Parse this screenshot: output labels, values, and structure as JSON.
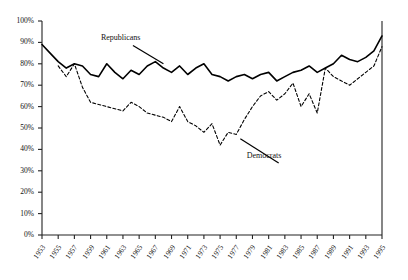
{
  "chart_data": {
    "type": "line",
    "title": "",
    "subtitle": "",
    "xlabel": "",
    "ylabel": "",
    "grid": false,
    "legend_position": "inline-annotation",
    "xlim": [
      1953,
      1995
    ],
    "ylim": [
      0,
      100
    ],
    "ytick_labels": [
      "100%",
      "90%",
      "80%",
      "70%",
      "60%",
      "50%",
      "40%",
      "30%",
      "20%",
      "10%",
      "0%"
    ],
    "ytick_values": [
      100,
      90,
      80,
      70,
      60,
      50,
      40,
      30,
      20,
      10,
      0
    ],
    "xtick_labels": [
      "1953",
      "1955",
      "1957",
      "1959",
      "1961",
      "1963",
      "1965",
      "1967",
      "1969",
      "1971",
      "1973",
      "1975",
      "1977",
      "1979",
      "1981",
      "1983",
      "1985",
      "1987",
      "1989",
      "1991",
      "1993",
      "1995"
    ],
    "xtick_values": [
      1953,
      1955,
      1957,
      1959,
      1961,
      1963,
      1965,
      1967,
      1969,
      1971,
      1973,
      1975,
      1977,
      1979,
      1981,
      1983,
      1985,
      1987,
      1989,
      1991,
      1993,
      1995
    ],
    "annotations": [
      {
        "text": "Republicans",
        "x": 1963,
        "y": 90,
        "leader_to_x": 1968,
        "leader_to_y": 80
      },
      {
        "text": "Democrats",
        "x": 1981,
        "y": 35,
        "leader_to_x": 1977.5,
        "leader_to_y": 45
      }
    ],
    "series": [
      {
        "name": "Republicans",
        "style": "solid",
        "color": "#000000",
        "x": [
          1953,
          1954,
          1955,
          1956,
          1957,
          1958,
          1959,
          1960,
          1961,
          1962,
          1963,
          1964,
          1965,
          1966,
          1967,
          1968,
          1969,
          1970,
          1971,
          1972,
          1973,
          1974,
          1975,
          1976,
          1977,
          1978,
          1979,
          1980,
          1981,
          1982,
          1983,
          1984,
          1985,
          1986,
          1987,
          1988,
          1989,
          1990,
          1991,
          1992,
          1993,
          1994,
          1995
        ],
        "values": [
          89,
          85,
          81,
          78,
          80,
          79,
          75,
          74,
          80,
          76,
          73,
          77,
          75,
          79,
          81,
          78,
          76,
          79,
          75,
          78,
          80,
          75,
          74,
          72,
          74,
          75,
          73,
          75,
          76,
          72,
          74,
          76,
          77,
          79,
          76,
          78,
          80,
          84,
          82,
          81,
          83,
          86,
          93
        ]
      },
      {
        "name": "Democrats",
        "style": "dashed",
        "color": "#000000",
        "x": [
          1955,
          1956,
          1957,
          1958,
          1959,
          1960,
          1961,
          1962,
          1963,
          1964,
          1965,
          1966,
          1967,
          1968,
          1969,
          1970,
          1971,
          1972,
          1973,
          1974,
          1975,
          1976,
          1977,
          1978,
          1979,
          1980,
          1981,
          1982,
          1983,
          1984,
          1985,
          1986,
          1987,
          1988,
          1989,
          1990,
          1991,
          1992,
          1993,
          1994,
          1995
        ],
        "values": [
          79,
          74,
          80,
          69,
          62,
          61,
          60,
          59,
          58,
          62,
          60,
          57,
          56,
          55,
          53,
          60,
          53,
          51,
          48,
          52,
          42,
          48,
          47,
          54,
          60,
          65,
          67,
          63,
          66,
          71,
          60,
          66,
          57,
          78,
          74,
          72,
          70,
          73,
          76,
          79,
          88
        ]
      }
    ]
  }
}
